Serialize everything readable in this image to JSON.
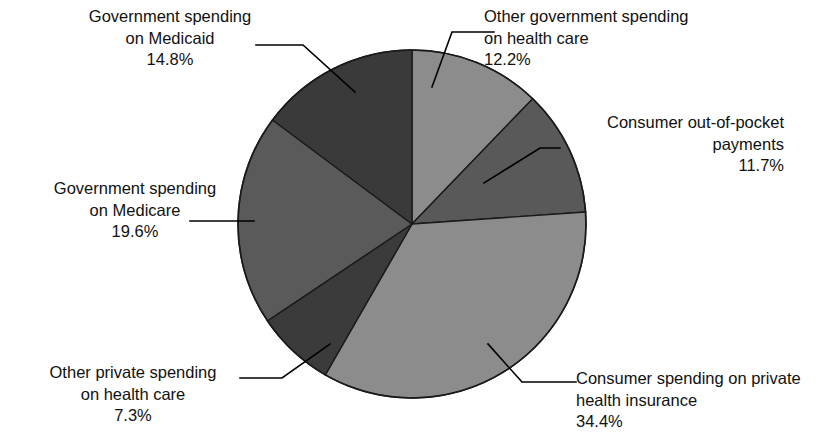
{
  "chart_data": {
    "type": "pie",
    "title": "",
    "subtitle": "",
    "xlabel": "",
    "ylabel": "",
    "legend_position": "none",
    "grid": false,
    "units": "percent",
    "start_angle_deg": 0,
    "direction": "clockwise",
    "total": 100.0,
    "categories": [
      "Other government spending on health care",
      "Consumer out-of-pocket payments",
      "Consumer spending on private health insurance",
      "Other private spending on health care",
      "Government spending on Medicare",
      "Government spending on Medicaid"
    ],
    "values": [
      12.2,
      11.7,
      34.4,
      7.3,
      19.6,
      14.8
    ],
    "value_labels": [
      "12.2%",
      "11.7%",
      "34.4%",
      "7.3%",
      "19.6%",
      "14.8%"
    ],
    "colors": [
      "#8c8c8c",
      "#595959",
      "#8c8c8c",
      "#3b3b3b",
      "#5a5a5a",
      "#3a3a3a"
    ],
    "slices": [
      {
        "id": "other-government-spending",
        "name_lines": [
          "Other government spending",
          "on health care"
        ],
        "percent_label": "12.2%",
        "value": 12.2,
        "color": "#8c8c8c",
        "start_deg": 0.0,
        "end_deg": 43.92
      },
      {
        "id": "consumer-out-of-pocket",
        "name_lines": [
          "Consumer out-of-pocket",
          "payments"
        ],
        "percent_label": "11.7%",
        "value": 11.7,
        "color": "#595959",
        "start_deg": 43.92,
        "end_deg": 86.04
      },
      {
        "id": "private-health-insurance",
        "name_lines": [
          "Consumer spending on private",
          "health insurance"
        ],
        "percent_label": "34.4%",
        "value": 34.4,
        "color": "#8c8c8c",
        "start_deg": 86.04,
        "end_deg": 209.88
      },
      {
        "id": "other-private-spending",
        "name_lines": [
          "Other private spending",
          "on health care"
        ],
        "percent_label": "7.3%",
        "value": 7.3,
        "color": "#3b3b3b",
        "start_deg": 209.88,
        "end_deg": 236.16
      },
      {
        "id": "government-spending-medicare",
        "name_lines": [
          "Government spending",
          "on Medicare"
        ],
        "percent_label": "19.6%",
        "value": 19.6,
        "color": "#5a5a5a",
        "start_deg": 236.16,
        "end_deg": 306.72
      },
      {
        "id": "government-spending-medicaid",
        "name_lines": [
          "Government spending",
          "on Medicaid"
        ],
        "percent_label": "14.8%",
        "value": 14.8,
        "color": "#3a3a3a",
        "start_deg": 306.72,
        "end_deg": 360.0
      }
    ]
  },
  "labels": {
    "medicaid": {
      "line1": "Government spending",
      "line2": "on Medicaid",
      "pct": "14.8%"
    },
    "medicare": {
      "line1": "Government spending",
      "line2": "on Medicare",
      "pct": "19.6%"
    },
    "otherprivate": {
      "line1": "Other private spending",
      "line2": "on health care",
      "pct": "7.3%"
    },
    "othergov": {
      "line1": "Other government spending",
      "line2": "on health care",
      "pct": "12.2%"
    },
    "oop": {
      "line1": "Consumer out-of-pocket",
      "line2": "payments",
      "pct": "11.7%"
    },
    "privateins": {
      "line1": "Consumer spending on private",
      "line2": "health insurance",
      "pct": "34.4%"
    }
  }
}
